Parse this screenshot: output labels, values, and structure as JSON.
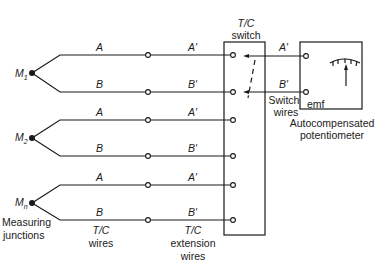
{
  "diagram": {
    "junctions": [
      {
        "label": "M",
        "sub": "1",
        "wires": [
          {
            "tc": "A",
            "ext": "A′"
          },
          {
            "tc": "B",
            "ext": "B′"
          }
        ]
      },
      {
        "label": "M",
        "sub": "2",
        "wires": [
          {
            "tc": "A",
            "ext": "A′"
          },
          {
            "tc": "B",
            "ext": "B′"
          }
        ]
      },
      {
        "label": "M",
        "sub": "n",
        "wires": [
          {
            "tc": "A",
            "ext": "A′"
          },
          {
            "tc": "B",
            "ext": "B′"
          }
        ]
      }
    ],
    "labels": {
      "measuring_junctions_1": "Measuring",
      "measuring_junctions_2": "junctions",
      "tc_wires_1": "T/C",
      "tc_wires_2": "wires",
      "ext_wires_1": "T/C",
      "ext_wires_2": "extension",
      "ext_wires_3": "wires",
      "switch_1": "T/C",
      "switch_2": "switch",
      "switch_wires_1": "Switch",
      "switch_wires_2": "wires",
      "switch_out_a": "A′",
      "switch_out_b": "B′",
      "emf": "emf",
      "pot_1": "Autocompensated",
      "pot_2": "potentiometer"
    },
    "colors": {
      "line": "#1a1a1a",
      "background": "#ffffff"
    }
  }
}
